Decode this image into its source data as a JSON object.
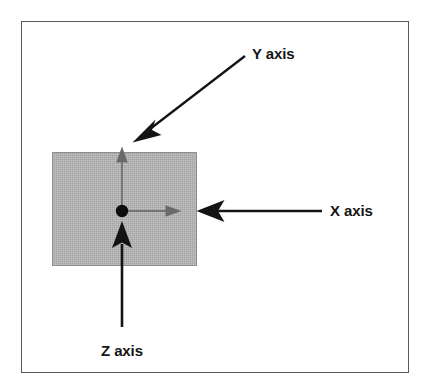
{
  "figure": {
    "kind": "axis-orientation-diagram",
    "frame_border_color": "#5a5a5a",
    "background_color": "#ffffff"
  },
  "plane": {
    "name": "shaded-xy-plane",
    "fill_color": "#b2b2b2",
    "stroke_color": "#8e8e8e"
  },
  "origin": {
    "name": "origin-point",
    "color": "#000000"
  },
  "axes": [
    {
      "id": "y",
      "label": "Y axis",
      "axis_arrow_color": "#5f5f5f",
      "axis_direction": "up",
      "pointer_color": "#141414",
      "pointer_direction": "down-left"
    },
    {
      "id": "x",
      "label": "X axis",
      "axis_arrow_color": "#5f5f5f",
      "axis_direction": "right",
      "pointer_color": "#141414",
      "pointer_direction": "left"
    },
    {
      "id": "z",
      "label": "Z axis",
      "axis_arrow_color": "#141414",
      "axis_direction": "up-out-of-plane",
      "pointer_color": "#141414",
      "pointer_direction": "up"
    }
  ],
  "labels": {
    "y_axis": "Y axis",
    "x_axis": "X axis",
    "z_axis": "Z axis"
  }
}
